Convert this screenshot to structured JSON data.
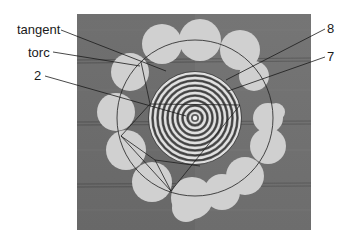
{
  "figure": {
    "labels": {
      "tangent": "tangent",
      "torc": "torc",
      "two": "2",
      "eight": "8",
      "seven": "7"
    },
    "colors": {
      "field": "#6e6e6e",
      "field_light": "#8a8a8a",
      "blob": "#d2d2d2",
      "ring_light": "#e4e4e4",
      "ring_dark": "#5a5a5a",
      "line": "#1a1a1a"
    }
  }
}
